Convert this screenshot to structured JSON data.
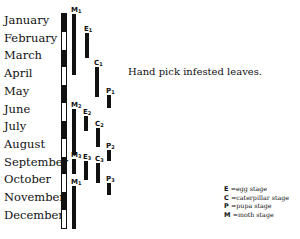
{
  "months": [
    "January",
    "February",
    "March",
    "April",
    "May",
    "June",
    "July",
    "August",
    "September",
    "October",
    "November",
    "December"
  ],
  "note": "Hand pick infested leaves.",
  "stages": [
    {
      "key": "M",
      "sub": "1",
      "col": 72,
      "top": 14,
      "bottom": 75,
      "label_top": 7
    },
    {
      "key": "E",
      "sub": "1",
      "col": 85,
      "top": 33,
      "bottom": 58,
      "label_top": 26
    },
    {
      "key": "C",
      "sub": "1",
      "col": 95,
      "top": 67,
      "bottom": 97,
      "label_top": 60
    },
    {
      "key": "P",
      "sub": "1",
      "col": 107,
      "top": 95,
      "bottom": 108,
      "label_top": 88
    },
    {
      "key": "M",
      "sub": "2",
      "col": 72,
      "top": 109,
      "bottom": 155,
      "label_top": 102
    },
    {
      "key": "E",
      "sub": "2",
      "col": 84,
      "top": 116,
      "bottom": 131,
      "label_top": 109
    },
    {
      "key": "C",
      "sub": "2",
      "col": 96,
      "top": 128,
      "bottom": 147,
      "label_top": 121
    },
    {
      "key": "P",
      "sub": "2",
      "col": 107,
      "top": 150,
      "bottom": 161,
      "label_top": 143
    },
    {
      "key": "M",
      "sub": "3",
      "col": 72,
      "top": 159,
      "bottom": 174,
      "label_top": 152
    },
    {
      "key": "E",
      "sub": "3",
      "col": 84,
      "top": 161,
      "bottom": 180,
      "label_top": 154
    },
    {
      "key": "C",
      "sub": "3",
      "col": 96,
      "top": 163,
      "bottom": 183,
      "label_top": 156
    },
    {
      "key": "P",
      "sub": "3",
      "col": 107,
      "top": 183,
      "bottom": 195,
      "label_top": 176
    },
    {
      "key": "M",
      "sub": "1",
      "col": 72,
      "top": 186,
      "bottom": 229,
      "label_top": 179
    }
  ],
  "legend": [
    {
      "key": "E",
      "text": "=egg stage"
    },
    {
      "key": "C",
      "text": "=caterpillar stage"
    },
    {
      "key": "P",
      "text": "=pupa stage"
    },
    {
      "key": "M",
      "text": "=moth stage"
    }
  ]
}
